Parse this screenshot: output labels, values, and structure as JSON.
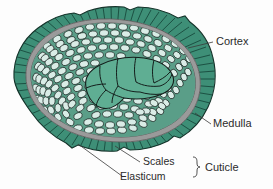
{
  "figure": {
    "background_color": "#fdfdfd"
  },
  "colors": {
    "cuticle_green": "#3e8f77",
    "cuticle_hatch": "#1d4f41",
    "elasticum_gray": "#9a9a9a",
    "medulla_green": "#5fae93",
    "medulla_outline": "#1c2b28",
    "cortex_fill": "#cfe6de",
    "cortex_outline": "#1c2b28",
    "cortex_bg": "#4e9b84",
    "label_text": "#2b2b2b",
    "leader_line": "#3a3a3a"
  },
  "labels": {
    "cortex": "Cortex",
    "medulla": "Medulla",
    "scales": "Scales",
    "elasticum": "Elasticum",
    "cuticle": "Cuticle"
  },
  "structures": [
    {
      "name": "cortex",
      "label": "Cortex",
      "description": "outer cell layer of small rounded cells"
    },
    {
      "name": "medulla",
      "label": "Medulla",
      "description": "central core of large polygonal cells"
    },
    {
      "name": "scales",
      "label": "Scales",
      "description": "outer hatched cuticle scale layer"
    },
    {
      "name": "elasticum",
      "label": "Elasticum",
      "description": "gray elastic ring beneath scales"
    },
    {
      "name": "cuticle",
      "label": "Cuticle",
      "description": "grouping of scales and elasticum"
    }
  ]
}
